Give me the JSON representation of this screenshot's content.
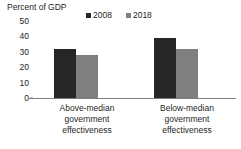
{
  "chart_data": {
    "type": "bar",
    "title": "",
    "ylabel": "Percent of GDP",
    "xlabel": "",
    "ylim": [
      0,
      50
    ],
    "yticks": [
      50,
      40,
      30,
      20,
      10,
      0
    ],
    "grid": false,
    "legend_position": "top",
    "categories": [
      "Above-median government effectiveness",
      "Below-median government effectiveness"
    ],
    "category_lines": [
      [
        "Above-median",
        "government",
        "effectiveness"
      ],
      [
        "Below-median",
        "government",
        "effectiveness"
      ]
    ],
    "series": [
      {
        "name": "2008",
        "color": "#262626",
        "values": [
          32,
          39
        ]
      },
      {
        "name": "2018",
        "color": "#7f7f7f",
        "values": [
          28,
          32
        ]
      }
    ]
  },
  "axis": {
    "y_title": "Percent of GDP",
    "ticks": [
      {
        "label": "50",
        "value": 50
      },
      {
        "label": "40",
        "value": 40
      },
      {
        "label": "30",
        "value": 30
      },
      {
        "label": "20",
        "value": 20
      },
      {
        "label": "10",
        "value": 10
      },
      {
        "label": "0",
        "value": 0
      }
    ]
  },
  "legend": {
    "items": [
      {
        "label": "2008",
        "color": "#262626"
      },
      {
        "label": "2018",
        "color": "#7f7f7f"
      }
    ]
  },
  "colors": {
    "series_2008": "#262626",
    "series_2018": "#7f7f7f",
    "axis_line": "#808080",
    "text": "#231f20",
    "background": "#ffffff"
  }
}
